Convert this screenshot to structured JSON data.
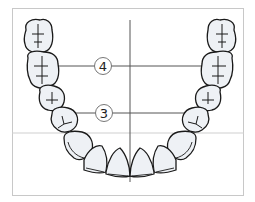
{
  "diagram": {
    "type": "dental-arch",
    "labels": [
      {
        "id": "4",
        "text": "4",
        "cx": 103,
        "cy": 66
      },
      {
        "id": "3",
        "text": "3",
        "cx": 104,
        "cy": 113
      }
    ],
    "colors": {
      "frame": "#c8c8c8",
      "tooth_fill": "#eef1f5",
      "tooth_stroke": "#1a1a1a",
      "reference_line": "#555555",
      "guide_line": "#cfcfcf"
    }
  }
}
